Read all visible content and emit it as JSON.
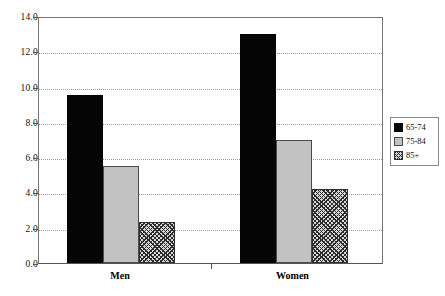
{
  "chart_data": {
    "type": "bar",
    "title": "",
    "xlabel": "",
    "ylabel": "",
    "categories": [
      "Men",
      "Women"
    ],
    "series": [
      {
        "name": "65-74",
        "values": [
          9.5,
          13.0
        ],
        "color": "#050505",
        "fill": "solid-black"
      },
      {
        "name": "75-84",
        "values": [
          5.5,
          7.0
        ],
        "color": "#c2c2c2",
        "fill": "solid-light-gray"
      },
      {
        "name": "85+",
        "values": [
          2.3,
          4.2
        ],
        "color": "#d8d8d8",
        "fill": "crosshatch"
      }
    ],
    "ylim": [
      0.0,
      14.0
    ],
    "ytick_step": 2.0,
    "yticks": [
      "0.0",
      "2.0",
      "4.0",
      "6.0",
      "8.0",
      "10.0",
      "12.0",
      "14.0"
    ],
    "grid": true,
    "grid_axis": "y",
    "legend_position": "right",
    "legend_entries": [
      "65-74",
      "75-84",
      "85+"
    ]
  },
  "axes": {
    "y_tick_labels": [
      "14.0",
      "12.0",
      "10.0",
      "8.0",
      "6.0",
      "4.0",
      "2.0",
      "0.0"
    ],
    "x_tick_labels": [
      "Men",
      "Women"
    ]
  },
  "legend": {
    "items": [
      {
        "label": "65-74"
      },
      {
        "label": "75-84"
      },
      {
        "label": "85+"
      }
    ]
  }
}
